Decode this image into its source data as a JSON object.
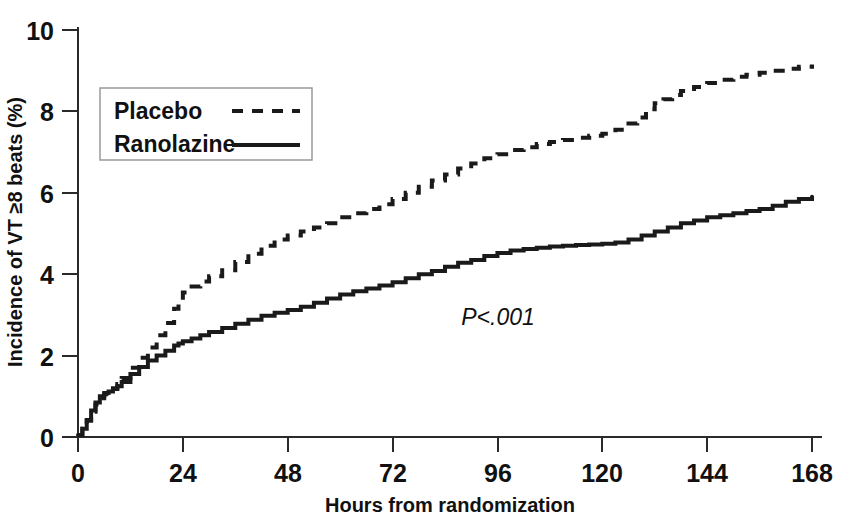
{
  "chart_data": {
    "type": "line",
    "title": "",
    "xlabel": "Hours from randomization",
    "ylabel": "Incidence of VT ≥8 beats (%)",
    "xlim": [
      0,
      168
    ],
    "ylim": [
      0,
      10
    ],
    "xticks": [
      0,
      24,
      48,
      72,
      96,
      120,
      144,
      168
    ],
    "xticklabels": [
      "0",
      "24",
      "48",
      "72",
      "96",
      "120",
      "144",
      "168"
    ],
    "yticks": [
      0,
      2,
      4,
      6,
      8,
      10
    ],
    "yticklabels": [
      "0",
      "2",
      "4",
      "6",
      "8",
      "10"
    ],
    "grid": false,
    "legend_position": "upper-left-inset",
    "annotations": [
      {
        "text": "P<.001",
        "x": 96,
        "y": 2.75,
        "style": "italic-P"
      }
    ],
    "series": [
      {
        "name": "Placebo",
        "linestyle": "dashed",
        "color": "#1a1a1a",
        "final_value": 9.15,
        "x": [
          0,
          1,
          2,
          3,
          4,
          5,
          6,
          7,
          8,
          9,
          10,
          12,
          14,
          16,
          18,
          20,
          22,
          23,
          24,
          26,
          28,
          30,
          33,
          36,
          39,
          42,
          45,
          48,
          51,
          54,
          57,
          60,
          63,
          66,
          69,
          72,
          75,
          78,
          81,
          84,
          87,
          90,
          93,
          96,
          99,
          102,
          105,
          108,
          111,
          114,
          117,
          120,
          123,
          126,
          128,
          130,
          132,
          134,
          136,
          138,
          141,
          144,
          147,
          150,
          153,
          156,
          159,
          162,
          165,
          168
        ],
        "y": [
          0.05,
          0.2,
          0.4,
          0.62,
          0.8,
          0.95,
          1.05,
          1.12,
          1.2,
          1.3,
          1.45,
          1.7,
          1.95,
          2.2,
          2.5,
          2.8,
          3.15,
          3.35,
          3.55,
          3.7,
          3.82,
          3.95,
          4.1,
          4.3,
          4.5,
          4.7,
          4.85,
          4.95,
          5.05,
          5.15,
          5.25,
          5.4,
          5.5,
          5.6,
          5.72,
          5.85,
          6.0,
          6.15,
          6.3,
          6.45,
          6.6,
          6.72,
          6.85,
          6.95,
          7.05,
          7.12,
          7.2,
          7.25,
          7.3,
          7.35,
          7.4,
          7.45,
          7.55,
          7.7,
          7.85,
          8.05,
          8.2,
          8.3,
          8.4,
          8.5,
          8.6,
          8.7,
          8.78,
          8.85,
          8.9,
          8.95,
          9.0,
          9.05,
          9.1,
          9.15
        ]
      },
      {
        "name": "Ranolazine",
        "linestyle": "solid",
        "color": "#1a1a1a",
        "final_value": 5.9,
        "x": [
          0,
          1,
          2,
          3,
          4,
          5,
          6,
          7,
          8,
          9,
          10,
          12,
          14,
          16,
          18,
          20,
          22,
          23,
          24,
          26,
          28,
          30,
          33,
          36,
          39,
          42,
          45,
          48,
          51,
          54,
          57,
          60,
          63,
          66,
          69,
          72,
          75,
          78,
          81,
          84,
          87,
          90,
          93,
          96,
          99,
          102,
          105,
          108,
          111,
          114,
          117,
          120,
          123,
          126,
          129,
          132,
          135,
          138,
          141,
          144,
          147,
          150,
          153,
          156,
          159,
          162,
          165,
          168
        ],
        "y": [
          0.05,
          0.2,
          0.42,
          0.65,
          0.85,
          1.0,
          1.08,
          1.12,
          1.18,
          1.25,
          1.35,
          1.55,
          1.72,
          1.88,
          2.0,
          2.12,
          2.25,
          2.3,
          2.35,
          2.42,
          2.5,
          2.58,
          2.68,
          2.78,
          2.88,
          2.98,
          3.05,
          3.12,
          3.2,
          3.3,
          3.4,
          3.5,
          3.58,
          3.65,
          3.72,
          3.8,
          3.9,
          4.0,
          4.08,
          4.18,
          4.28,
          4.35,
          4.45,
          4.52,
          4.58,
          4.62,
          4.65,
          4.68,
          4.7,
          4.72,
          4.73,
          4.75,
          4.78,
          4.85,
          4.95,
          5.05,
          5.15,
          5.25,
          5.32,
          5.4,
          5.45,
          5.5,
          5.55,
          5.6,
          5.68,
          5.78,
          5.85,
          5.9
        ]
      }
    ]
  },
  "legend": {
    "items": [
      {
        "label": "Placebo",
        "style": "dashed"
      },
      {
        "label": "Ranolazine",
        "style": "solid"
      }
    ]
  }
}
